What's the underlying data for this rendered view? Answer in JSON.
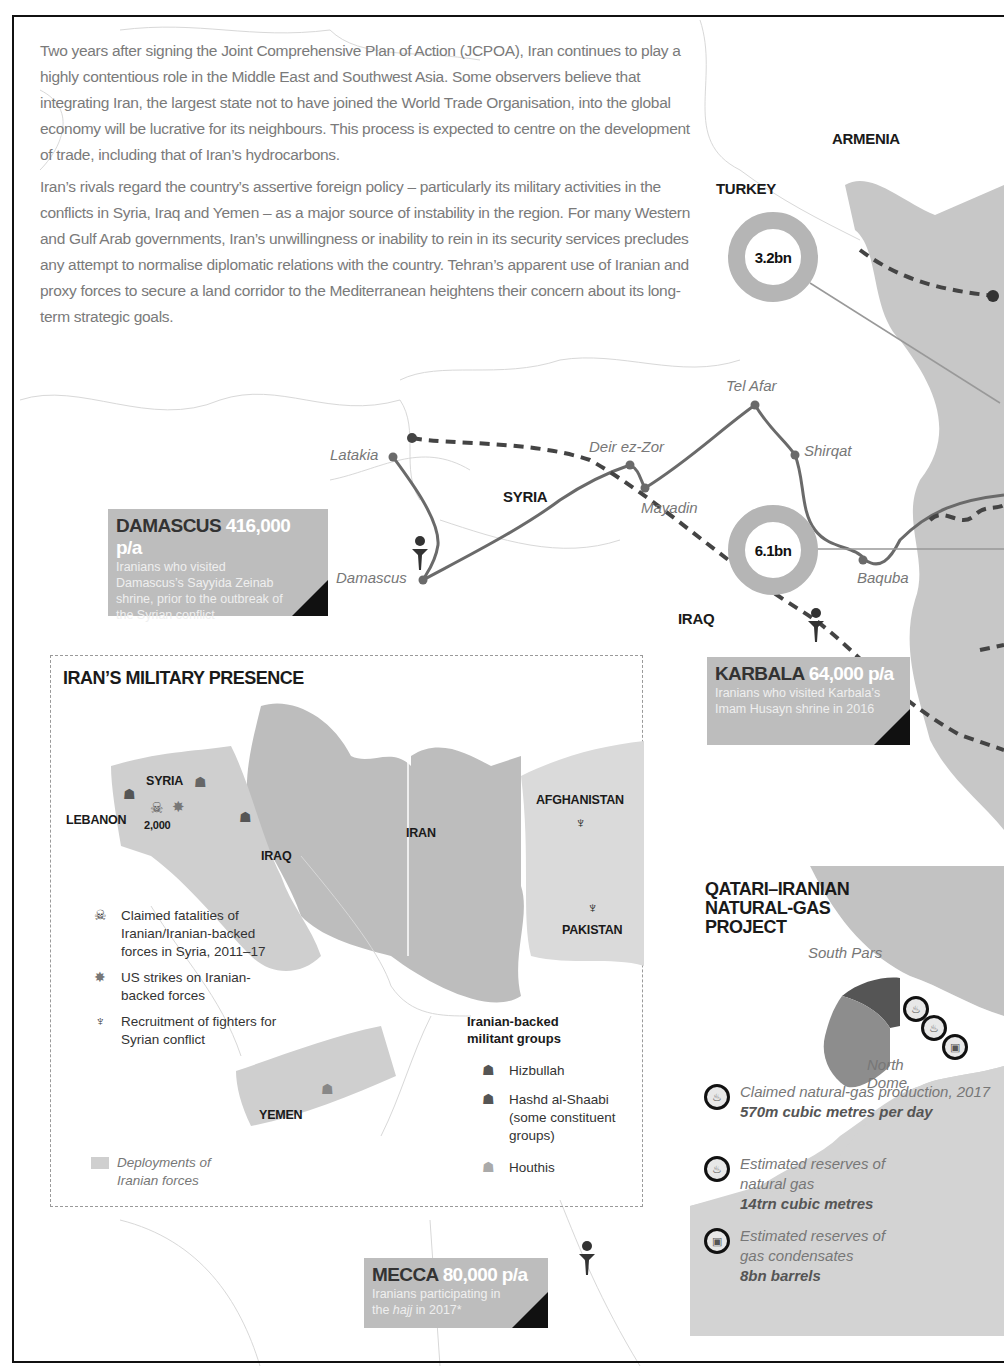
{
  "intro": {
    "paragraphs": [
      "Two years after signing the Joint Comprehensive Plan of Action (JCPOA), Iran continues to play a highly contentious role in the Middle East and Southwest Asia. Some observers believe that integrating Iran, the largest state not to have joined the World Trade Organisation, into the global economy will be lucrative for its neighbours. This process is expected to centre on the development of trade, including that of Iran’s hydrocarbons.",
      "Iran’s rivals regard the country’s assertive foreign policy – particularly its military activities in the conflicts in Syria, Iraq and Yemen – as a major source of instability in the region. For many Western and Gulf Arab governments, Iran’s unwillingness or inability to rein in its security services precludes any attempt to normalise diplomatic relations with the country. Tehran’s apparent use of Iranian and proxy forces to secure a land corridor to the Mediterranean heightens their concern about its long-term strategic goals."
    ]
  },
  "main_map": {
    "countries": {
      "armenia": "ARMENIA",
      "turkey": "TURKEY",
      "syria": "SYRIA",
      "iraq": "IRAQ"
    },
    "cities": {
      "latakia": "Latakia",
      "damascus": "Damascus",
      "deir": "Deir ez-Zor",
      "mayadin": "Mayadin",
      "telafar": "Tel Afar",
      "shirqat": "Shirqat",
      "baqaba": "Baquba"
    },
    "trade_rings": [
      {
        "label": "3.2bn",
        "country": "Turkey"
      },
      {
        "label": "6.1bn",
        "country": "Iraq"
      }
    ],
    "callouts": {
      "damascus": {
        "place": "DAMASCUS",
        "value": "416,000 p/a",
        "desc": "Iranians who visited Damascus’s Sayyida Zeinab shrine, prior to the outbreak of the Syrian conflict"
      },
      "karbala": {
        "place": "KARBALA",
        "value": "64,000 p/a",
        "desc": "Iranians who visited Karbala’s Imam Husayn shrine in 2016"
      },
      "mecca": {
        "place": "MECCA",
        "value": "80,000 p/a",
        "desc_pre": "Iranians participating in the ",
        "desc_em": "hajj",
        "desc_post": " in 2017*"
      }
    }
  },
  "inset": {
    "title": "IRAN’S MILITARY PRESENCE",
    "labels": {
      "syria": "SYRIA",
      "lebanon": "LEBANON",
      "iraq": "IRAQ",
      "iran": "IRAN",
      "afghanistan": "AFGHANISTAN",
      "pakistan": "PAKISTAN",
      "yemen": "YEMEN",
      "fatalities": "2,000"
    },
    "legend": {
      "fatalities": "Claimed fatalities of Iranian/Iranian-backed forces in Syria, 2011–17",
      "strikes": "US strikes on Iranian-backed forces",
      "recruitment": "Recruitment of fighters for Syrian conflict",
      "deployments": "Deployments of Iranian forces"
    },
    "militant_groups": {
      "heading": "Iranian-backed militant groups",
      "items": [
        "Hizbullah",
        "Hashd al-Shaabi (some constituent groups)",
        "Houthis"
      ]
    }
  },
  "qatar_panel": {
    "title": "QATARI–IRANIAN NATURAL-GAS PROJECT",
    "labels": {
      "south_pars": "South Pars",
      "north_dome": "North Dome"
    },
    "items": [
      {
        "label": "Claimed natural-gas production, 2017",
        "value": "570m cubic metres per day"
      },
      {
        "label": "Estimated reserves of natural gas",
        "value": "14trn cubic metres"
      },
      {
        "label": "Estimated reserves of gas condensates",
        "value": "8bn barrels"
      }
    ]
  },
  "colors": {
    "iran_fill": "#bdbdbd",
    "deploy_fill": "#cfcfcf",
    "route": "#6a6a6a",
    "dashed": "#444444",
    "callout": "#bdbdbd",
    "text_grey": "#7a7a7a"
  }
}
